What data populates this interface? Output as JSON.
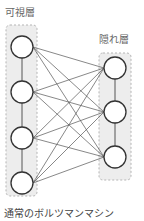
{
  "diagram": {
    "visible_layer": {
      "label": "可視層",
      "nodes": [
        {
          "x": 22,
          "y": 47
        },
        {
          "x": 22,
          "y": 92
        },
        {
          "x": 22,
          "y": 138
        },
        {
          "x": 22,
          "y": 183
        }
      ],
      "box": {
        "x": 6,
        "y": 25,
        "w": 31,
        "h": 171
      }
    },
    "hidden_layer": {
      "label": "隠れ層",
      "nodes": [
        {
          "x": 115,
          "y": 68
        },
        {
          "x": 115,
          "y": 112
        },
        {
          "x": 115,
          "y": 157
        }
      ],
      "box": {
        "x": 99,
        "y": 53,
        "w": 32,
        "h": 127
      }
    },
    "caption": "通常のボルツマンマシン",
    "node_radius": 11,
    "colors": {
      "box_fill": "#ededed",
      "box_stroke": "#b5b5b5",
      "edge": "#555555",
      "node_stroke": "#333333",
      "node_fill": "#ffffff"
    }
  }
}
